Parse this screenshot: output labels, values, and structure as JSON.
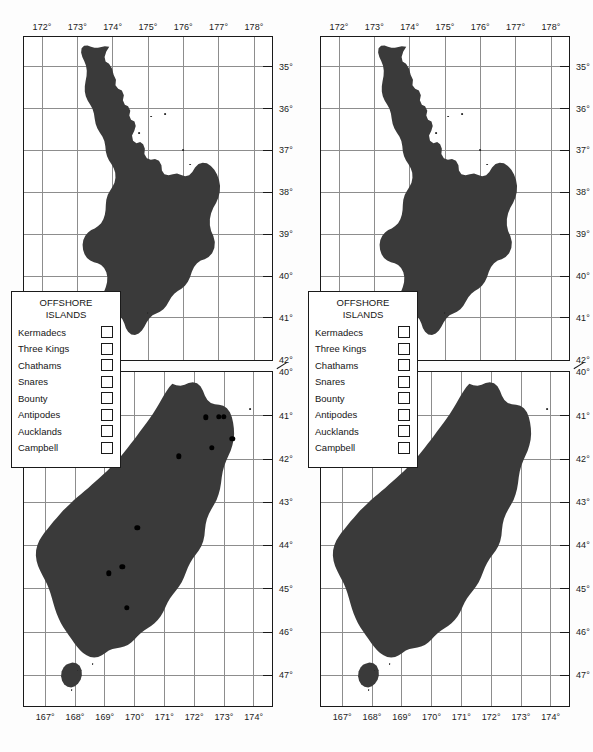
{
  "figure": {
    "caption": "",
    "background": "#fdfdfd",
    "ink": "#1a1a1a",
    "grid_color": "#8d8d8d",
    "dot_color": "#000000"
  },
  "legend": {
    "title_line1": "OFFSHORE",
    "title_line2": "ISLANDS",
    "items": [
      {
        "label": "Kermadecs",
        "checked": false
      },
      {
        "label": "Three Kings",
        "checked": false
      },
      {
        "label": "Chathams",
        "checked": false
      },
      {
        "label": "Snares",
        "checked": false
      },
      {
        "label": "Bounty",
        "checked": false
      },
      {
        "label": "Antipodes",
        "checked": false
      },
      {
        "label": "Aucklands",
        "checked": false
      },
      {
        "label": "Campbell",
        "checked": false
      }
    ]
  },
  "panels": [
    {
      "id": "left",
      "has_records": true
    },
    {
      "id": "right",
      "has_records": false
    }
  ],
  "chart_data": {
    "type": "scatter",
    "title": "",
    "xlabel": "",
    "ylabel": "",
    "maps": [
      {
        "name": "north-island",
        "xlim": [
          171.5,
          178.5
        ],
        "ylim": [
          34.3,
          42.0
        ],
        "xticks": [
          172,
          173,
          174,
          175,
          176,
          177,
          178
        ],
        "xticklabels": [
          "172°",
          "173°",
          "174°",
          "175°",
          "176°",
          "177°",
          "178°"
        ],
        "yticks": [
          35,
          36,
          37,
          38,
          39,
          40,
          41,
          42
        ],
        "yticklabels": [
          "35°",
          "36°",
          "37°",
          "38°",
          "39°",
          "40°",
          "41°",
          "42°"
        ],
        "grid": true,
        "tick_side": "right",
        "tick_label_position": "top",
        "records": []
      },
      {
        "name": "south-island",
        "xlim": [
          166.3,
          174.6
        ],
        "ylim": [
          40.0,
          47.7
        ],
        "xticks": [
          167,
          168,
          169,
          170,
          171,
          172,
          173,
          174
        ],
        "xticklabels": [
          "167°",
          "168°",
          "169°",
          "170°",
          "171°",
          "172°",
          "173°",
          "174°"
        ],
        "yticks": [
          40,
          41,
          42,
          43,
          44,
          45,
          46,
          47
        ],
        "yticklabels": [
          "40°",
          "41°",
          "42°",
          "43°",
          "44°",
          "45°",
          "46°",
          "47°"
        ],
        "grid": true,
        "tick_side": "right",
        "tick_label_position": "bottom",
        "records": [
          {
            "lon": 172.4,
            "lat": 41.05
          },
          {
            "lon": 172.85,
            "lat": 41.03
          },
          {
            "lon": 173.0,
            "lat": 41.03
          },
          {
            "lon": 173.3,
            "lat": 41.55
          },
          {
            "lon": 172.6,
            "lat": 41.75
          },
          {
            "lon": 171.5,
            "lat": 41.95
          },
          {
            "lon": 170.1,
            "lat": 43.6
          },
          {
            "lon": 169.6,
            "lat": 44.5
          },
          {
            "lon": 169.15,
            "lat": 44.65
          },
          {
            "lon": 169.75,
            "lat": 45.45
          }
        ]
      }
    ]
  }
}
